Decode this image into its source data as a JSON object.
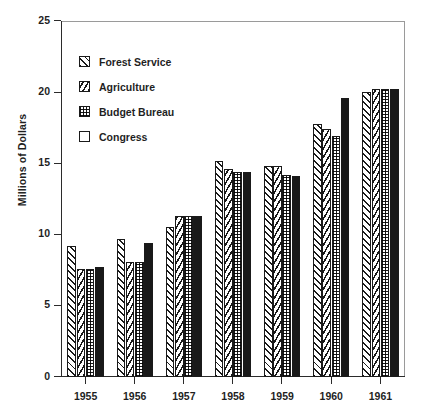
{
  "chart_data": {
    "type": "bar",
    "title": "",
    "subtitle": "",
    "xlabel": "",
    "ylabel": "Millions of Dollars",
    "categories": [
      "1955",
      "1956",
      "1957",
      "1958",
      "1959",
      "1960",
      "1961"
    ],
    "ylim": [
      0,
      25
    ],
    "yticks": [
      0,
      5,
      10,
      15,
      20,
      25
    ],
    "ytick_labels": [
      "0",
      "5",
      "10",
      "15",
      "20",
      "25"
    ],
    "grid": false,
    "legend_position": "inside-upper-left",
    "series": [
      {
        "name": "Forest Service",
        "pattern": "diagonal-hatch",
        "values": [
          9.2,
          9.7,
          10.5,
          15.2,
          14.8,
          17.8,
          20.0
        ]
      },
      {
        "name": "Agriculture",
        "pattern": "chevron-hatch",
        "values": [
          7.6,
          8.1,
          11.3,
          14.6,
          14.8,
          17.4,
          20.2
        ]
      },
      {
        "name": "Budget Bureau",
        "pattern": "dot-grid",
        "values": [
          7.6,
          8.1,
          11.3,
          14.4,
          14.2,
          16.9,
          20.2
        ]
      },
      {
        "name": "Congress",
        "pattern": "solid-black",
        "values": [
          7.7,
          9.4,
          11.3,
          14.4,
          14.1,
          19.6,
          20.2
        ]
      }
    ]
  },
  "colors": {
    "ink": "#1a1a1a",
    "axis": "#2b2b2b",
    "frame": "#9a9a9a",
    "background": "#ffffff"
  }
}
